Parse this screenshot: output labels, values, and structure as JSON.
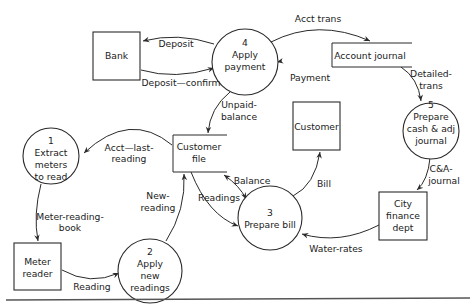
{
  "diagram": {
    "type": "data-flow-diagram",
    "processes": [
      {
        "id": "p1",
        "number": "1",
        "lines": [
          "Extract",
          "meters",
          "to read"
        ]
      },
      {
        "id": "p2",
        "number": "2",
        "lines": [
          "Apply",
          "new",
          "readings"
        ]
      },
      {
        "id": "p3",
        "number": "3",
        "lines": [
          "Prepare bill"
        ]
      },
      {
        "id": "p4",
        "number": "4",
        "lines": [
          "Apply",
          "payment"
        ]
      },
      {
        "id": "p5",
        "number": "5",
        "lines": [
          "Prepare",
          "cash & adj",
          "journal"
        ]
      }
    ],
    "entities": [
      {
        "id": "bank",
        "lines": [
          "Bank"
        ]
      },
      {
        "id": "customer",
        "lines": [
          "Customer"
        ]
      },
      {
        "id": "city",
        "lines": [
          "City",
          "finance",
          "dept"
        ]
      },
      {
        "id": "meter",
        "lines": [
          "Meter",
          "reader"
        ]
      }
    ],
    "stores": [
      {
        "id": "acct_journal",
        "lines": [
          "Account journal"
        ]
      },
      {
        "id": "cust_file",
        "lines": [
          "Customer",
          "file"
        ]
      }
    ],
    "flows": [
      {
        "id": "f_deposit",
        "lines": [
          "Deposit"
        ],
        "from": "p4",
        "to": "bank"
      },
      {
        "id": "f_deposit_confirm",
        "lines": [
          "Deposit—confirm"
        ],
        "from": "bank",
        "to": "p4"
      },
      {
        "id": "f_acct_trans",
        "lines": [
          "Acct trans"
        ],
        "from": "p4",
        "to": "acct_journal"
      },
      {
        "id": "f_payment",
        "lines": [
          "Payment"
        ],
        "from": "external",
        "to": "p4"
      },
      {
        "id": "f_detailed_trans",
        "lines": [
          "Detailed-",
          "trans"
        ],
        "from": "acct_journal",
        "to": "p5"
      },
      {
        "id": "f_unpaid_balance",
        "lines": [
          "Unpaid-",
          "balance"
        ],
        "from": "p4",
        "to": "cust_file"
      },
      {
        "id": "f_acct_last_reading",
        "lines": [
          "Acct—last-",
          "reading"
        ],
        "from": "cust_file",
        "to": "p1"
      },
      {
        "id": "f_meter_reading_book",
        "lines": [
          "Meter-reading-",
          "book"
        ],
        "from": "p1",
        "to": "meter"
      },
      {
        "id": "f_reading",
        "lines": [
          "Reading"
        ],
        "from": "meter",
        "to": "p2"
      },
      {
        "id": "f_new_reading",
        "lines": [
          "New-",
          "reading"
        ],
        "from": "p2",
        "to": "cust_file"
      },
      {
        "id": "f_readings",
        "lines": [
          "Readings"
        ],
        "from": "cust_file",
        "to": "p3"
      },
      {
        "id": "f_balance",
        "lines": [
          "Balance"
        ],
        "from": "cust_file",
        "to": "p3",
        "bidirectional": true
      },
      {
        "id": "f_bill",
        "lines": [
          "Bill"
        ],
        "from": "p3",
        "to": "customer"
      },
      {
        "id": "f_ca_journal",
        "lines": [
          "C&A-",
          "journal"
        ],
        "from": "p5",
        "to": "city"
      },
      {
        "id": "f_water_rates",
        "lines": [
          "Water-rates"
        ],
        "from": "city",
        "to": "p3"
      }
    ]
  }
}
